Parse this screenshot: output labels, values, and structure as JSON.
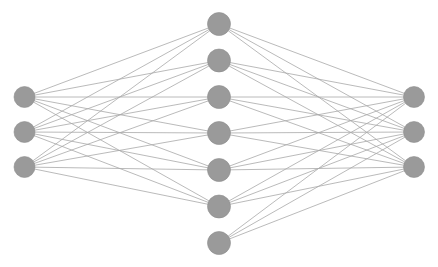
{
  "diagram": {
    "type": "node-link-graph",
    "background_color": "#ffffff",
    "node_color": "#9a9a9a",
    "node_stroke_color": "#8f8f8f",
    "edge_color": "#a8a8a8",
    "edge_width": 0.8,
    "canvas": {
      "width": 438,
      "height": 267
    },
    "layers": [
      {
        "id": "input",
        "name": "input-layer",
        "label": "Input layer",
        "node_count": 3,
        "x": 24.5,
        "radius": 10.5,
        "nodes": [
          {
            "id": "i1",
            "label": "",
            "cx": 24.5,
            "cy": 97.0
          },
          {
            "id": "i2",
            "label": "",
            "cx": 24.5,
            "cy": 132.0
          },
          {
            "id": "i3",
            "label": "",
            "cx": 24.5,
            "cy": 167.0
          }
        ]
      },
      {
        "id": "hidden",
        "name": "hidden-layer",
        "label": "Hidden layer",
        "node_count": 7,
        "x": 219.0,
        "radius": 11.5,
        "nodes": [
          {
            "id": "h1",
            "label": "",
            "cx": 219.0,
            "cy": 24.0
          },
          {
            "id": "h2",
            "label": "",
            "cx": 219.0,
            "cy": 60.5
          },
          {
            "id": "h3",
            "label": "",
            "cx": 219.0,
            "cy": 97.0
          },
          {
            "id": "h4",
            "label": "",
            "cx": 219.0,
            "cy": 133.0
          },
          {
            "id": "h5",
            "label": "",
            "cx": 219.0,
            "cy": 170.0
          },
          {
            "id": "h6",
            "label": "",
            "cx": 219.0,
            "cy": 206.5
          },
          {
            "id": "h7",
            "label": "",
            "cx": 219.0,
            "cy": 243.0
          }
        ]
      },
      {
        "id": "output",
        "name": "output-layer",
        "label": "Output layer",
        "node_count": 3,
        "x": 414.0,
        "radius": 10.5,
        "nodes": [
          {
            "id": "o1",
            "label": "",
            "cx": 414.0,
            "cy": 97.0
          },
          {
            "id": "o2",
            "label": "",
            "cx": 414.0,
            "cy": 132.0
          },
          {
            "id": "o3",
            "label": "",
            "cx": 414.0,
            "cy": 167.0
          }
        ]
      }
    ],
    "edges": [
      {
        "from": "i1",
        "to": "h1"
      },
      {
        "from": "i1",
        "to": "h2"
      },
      {
        "from": "i1",
        "to": "h3"
      },
      {
        "from": "i1",
        "to": "h4"
      },
      {
        "from": "i1",
        "to": "h5"
      },
      {
        "from": "i1",
        "to": "h6"
      },
      {
        "from": "i2",
        "to": "h1"
      },
      {
        "from": "i2",
        "to": "h2"
      },
      {
        "from": "i2",
        "to": "h3"
      },
      {
        "from": "i2",
        "to": "h4"
      },
      {
        "from": "i2",
        "to": "h5"
      },
      {
        "from": "i2",
        "to": "h6"
      },
      {
        "from": "i3",
        "to": "h1"
      },
      {
        "from": "i3",
        "to": "h2"
      },
      {
        "from": "i3",
        "to": "h3"
      },
      {
        "from": "i3",
        "to": "h4"
      },
      {
        "from": "i3",
        "to": "h5"
      },
      {
        "from": "i3",
        "to": "h6"
      },
      {
        "from": "h1",
        "to": "o1"
      },
      {
        "from": "h1",
        "to": "o2"
      },
      {
        "from": "h1",
        "to": "o3"
      },
      {
        "from": "h2",
        "to": "o1"
      },
      {
        "from": "h2",
        "to": "o2"
      },
      {
        "from": "h2",
        "to": "o3"
      },
      {
        "from": "h3",
        "to": "o1"
      },
      {
        "from": "h3",
        "to": "o2"
      },
      {
        "from": "h3",
        "to": "o3"
      },
      {
        "from": "h4",
        "to": "o1"
      },
      {
        "from": "h4",
        "to": "o2"
      },
      {
        "from": "h4",
        "to": "o3"
      },
      {
        "from": "h5",
        "to": "o1"
      },
      {
        "from": "h5",
        "to": "o2"
      },
      {
        "from": "h5",
        "to": "o3"
      },
      {
        "from": "h6",
        "to": "o1"
      },
      {
        "from": "h6",
        "to": "o2"
      },
      {
        "from": "h6",
        "to": "o3"
      },
      {
        "from": "h7",
        "to": "o1"
      },
      {
        "from": "h7",
        "to": "o2"
      },
      {
        "from": "h7",
        "to": "o3"
      }
    ]
  }
}
